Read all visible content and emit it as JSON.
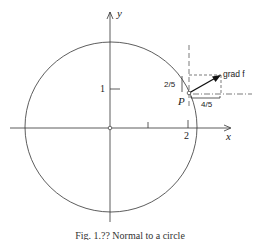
{
  "figure": {
    "caption": "Fig. 1.?? Normal to a circle",
    "axes": {
      "x_label": "x",
      "y_label": "y",
      "x_tick_labels": [
        "2"
      ],
      "y_tick_labels": [
        "1"
      ]
    },
    "point_label": "P",
    "vector_label": "grad f",
    "vertical_component_label": "2/5",
    "horizontal_component_label": "4/5",
    "colors": {
      "ink": "#222222",
      "background": "#ffffff"
    }
  }
}
